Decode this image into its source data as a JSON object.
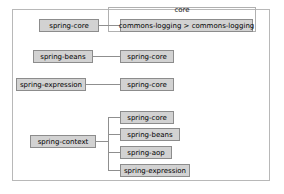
{
  "diagram": {
    "title": "core",
    "group_label": "core",
    "colors": {
      "node_fill": "#d2d2d2",
      "node_border": "#8c8c8c",
      "frame_border": "#b8b8b8",
      "line": "#8f8f8f",
      "text": "#000000",
      "background": "#ffffff"
    },
    "rows": [
      {
        "id": "row-1",
        "source": "spring-core",
        "target": "commons-logging > commons-logging"
      },
      {
        "id": "row-2",
        "source": "spring-beans",
        "target": "spring-core"
      },
      {
        "id": "row-3",
        "source": "spring-expression",
        "target": "spring-core"
      }
    ],
    "tree": {
      "root": "spring-context",
      "children": [
        "spring-core",
        "spring-beans",
        "spring-aop",
        "spring-expression"
      ]
    }
  }
}
